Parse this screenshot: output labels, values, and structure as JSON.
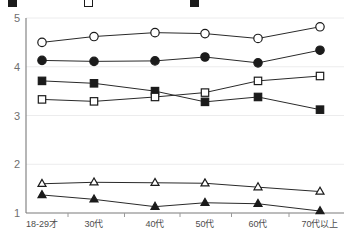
{
  "legend": {
    "note_clipped": true,
    "items": [
      {
        "marker": "filled-square",
        "label": ""
      },
      {
        "marker": "open-square",
        "label": ""
      },
      {
        "marker": "filled-square",
        "label": ""
      }
    ]
  },
  "axes": {
    "y_ticks": [
      "5",
      "4",
      "3",
      "2",
      "1"
    ],
    "x_ticks": [
      "18-29才",
      "30代",
      "40代",
      "50代",
      "60代",
      "70代以上"
    ]
  },
  "colors": {
    "line": "#2a2a2a",
    "marker_fill": "#1b1b1b",
    "marker_open": "#ffffff",
    "grid": "#ececed",
    "axis": "#7a7a7a",
    "tick_text": "#6f6f6f",
    "background": "#ffffff"
  },
  "chart_data": {
    "type": "line",
    "title": "",
    "subtitle": "",
    "xlabel": "",
    "ylabel": "",
    "ylim": [
      1,
      5
    ],
    "yticks": [
      1,
      2,
      3,
      4,
      5
    ],
    "grid": true,
    "legend_position": "top",
    "legend_clipped": true,
    "categories": [
      "18-29才",
      "30代",
      "40代",
      "50代",
      "60代",
      "70代以上"
    ],
    "series": [
      {
        "name": "series-1",
        "marker": "open-circle",
        "values": [
          4.5,
          4.62,
          4.7,
          4.68,
          4.58,
          4.82
        ]
      },
      {
        "name": "series-2",
        "marker": "filled-circle",
        "values": [
          4.13,
          4.11,
          4.12,
          4.2,
          4.08,
          4.34
        ]
      },
      {
        "name": "series-3",
        "marker": "filled-square",
        "values": [
          3.71,
          3.66,
          3.5,
          3.28,
          3.38,
          3.12
        ]
      },
      {
        "name": "series-4",
        "marker": "open-square",
        "values": [
          3.33,
          3.29,
          3.38,
          3.47,
          3.71,
          3.81
        ]
      },
      {
        "name": "series-5",
        "marker": "open-triangle",
        "values": [
          1.6,
          1.63,
          1.62,
          1.61,
          1.53,
          1.44
        ]
      },
      {
        "name": "series-6",
        "marker": "filled-triangle",
        "values": [
          1.37,
          1.28,
          1.13,
          1.21,
          1.19,
          1.04
        ]
      }
    ]
  },
  "geometry": {
    "plot_left": 26,
    "plot_right": 344,
    "plot_top": 18,
    "plot_bottom": 213,
    "x_positions": [
      42,
      94,
      155,
      205,
      258,
      320
    ],
    "legend_item_x": [
      8,
      84,
      190
    ]
  }
}
